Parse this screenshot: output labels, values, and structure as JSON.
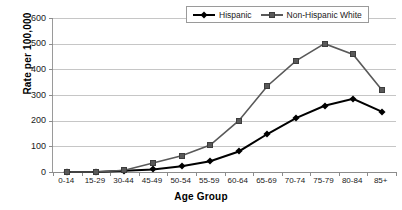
{
  "chart_data": {
    "type": "line",
    "title": "",
    "xlabel": "Age Group",
    "ylabel": "Rate per 100,000",
    "categories": [
      "0-14",
      "15-29",
      "30-44",
      "45-49",
      "50-54",
      "55-59",
      "60-64",
      "65-69",
      "70-74",
      "75-79",
      "80-84",
      "85+"
    ],
    "ylim": [
      0,
      600
    ],
    "ytick_labels": [
      "600",
      "500",
      "400",
      "300",
      "200",
      "100",
      "0"
    ],
    "ytick_values": [
      600,
      500,
      400,
      300,
      200,
      100,
      0
    ],
    "grid": true,
    "legend_position": "top-right",
    "series": [
      {
        "name": "Hispanic",
        "color": "#000000",
        "marker": "diamond",
        "values": [
          0,
          0,
          5,
          10,
          22,
          42,
          80,
          148,
          210,
          258,
          285,
          235
        ]
      },
      {
        "name": "Non-Hispanic White",
        "color": "#595959",
        "marker": "square",
        "values": [
          0,
          0,
          7,
          35,
          63,
          105,
          200,
          335,
          433,
          500,
          458,
          320
        ]
      }
    ]
  },
  "colors": {
    "hispanic": "#000000",
    "non_hispanic_white": "#595959",
    "gridline": "#c6c6c6",
    "axis": "#8c8c8c",
    "background": "#ffffff"
  }
}
